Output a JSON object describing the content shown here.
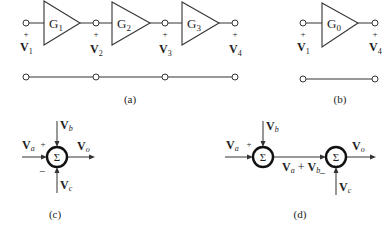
{
  "figure": {
    "panels": [
      {
        "id": "a",
        "caption": "(a)",
        "description": "Cascade of three amplifier stages",
        "blocks": [
          {
            "label": "G",
            "sub": "1"
          },
          {
            "label": "G",
            "sub": "2"
          },
          {
            "label": "G",
            "sub": "3"
          }
        ],
        "nodes": [
          {
            "label": "V",
            "sub": "1",
            "polarity": "+"
          },
          {
            "label": "V",
            "sub": "2",
            "polarity": "+"
          },
          {
            "label": "V",
            "sub": "3",
            "polarity": "+"
          },
          {
            "label": "V",
            "sub": "4",
            "polarity": "+"
          }
        ]
      },
      {
        "id": "b",
        "caption": "(b)",
        "description": "Equivalent single amplifier",
        "blocks": [
          {
            "label": "G",
            "sub": "0"
          }
        ],
        "nodes": [
          {
            "label": "V",
            "sub": "1",
            "polarity": "+"
          },
          {
            "label": "V",
            "sub": "4",
            "polarity": "+"
          }
        ]
      },
      {
        "id": "c",
        "caption": "(c)",
        "description": "Single summing junction with three inputs",
        "junction_symbol": "Σ",
        "inputs": [
          {
            "label": "V",
            "sub": "a",
            "sign": "+"
          },
          {
            "label": "V",
            "sub": "b",
            "sign": ""
          },
          {
            "label": "V",
            "sub": "c",
            "sign": "−"
          }
        ],
        "output": {
          "label": "V",
          "sub": "o"
        }
      },
      {
        "id": "d",
        "caption": "(d)",
        "description": "Two cascaded summing junctions",
        "junction_symbol": "Σ",
        "inputs": [
          {
            "label": "V",
            "sub": "a",
            "sign": "+"
          },
          {
            "label": "V",
            "sub": "b",
            "sign": ""
          },
          {
            "label": "V",
            "sub": "c",
            "sign": "−"
          }
        ],
        "intermediate": {
          "parts": [
            {
              "label": "V",
              "sub": "a"
            },
            {
              "op": " + "
            },
            {
              "label": "V",
              "sub": "b"
            }
          ]
        },
        "output": {
          "label": "V",
          "sub": "o"
        }
      }
    ]
  }
}
